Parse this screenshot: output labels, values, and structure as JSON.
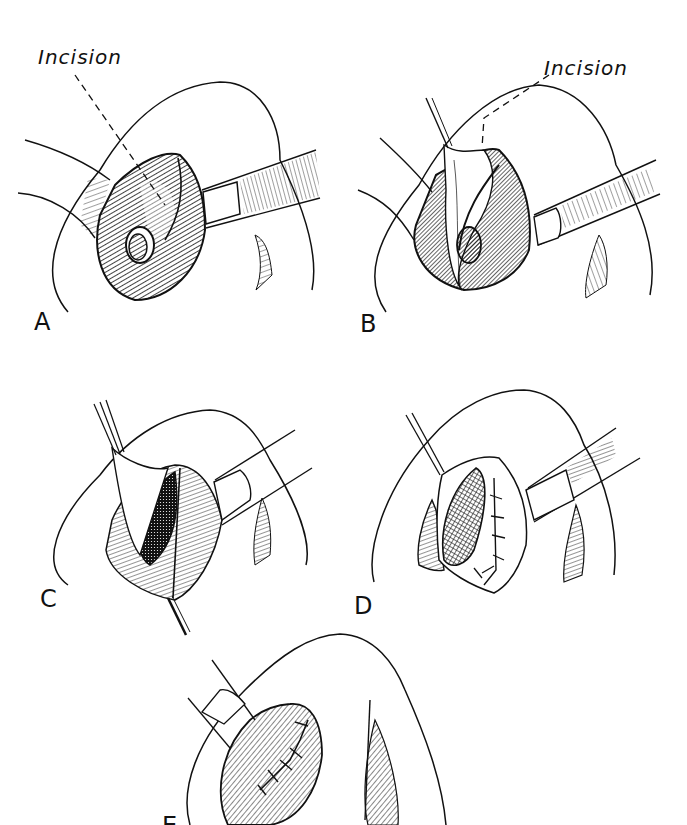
{
  "figure": {
    "type": "surgical-illustration",
    "colors": {
      "ink": "#111111",
      "background": "#ffffff"
    },
    "panels": [
      {
        "id": "A",
        "label": "A",
        "callout": "Incision"
      },
      {
        "id": "B",
        "label": "B",
        "callout": "Incision"
      },
      {
        "id": "C",
        "label": "C"
      },
      {
        "id": "D",
        "label": "D"
      },
      {
        "id": "E",
        "label": "E"
      }
    ]
  }
}
